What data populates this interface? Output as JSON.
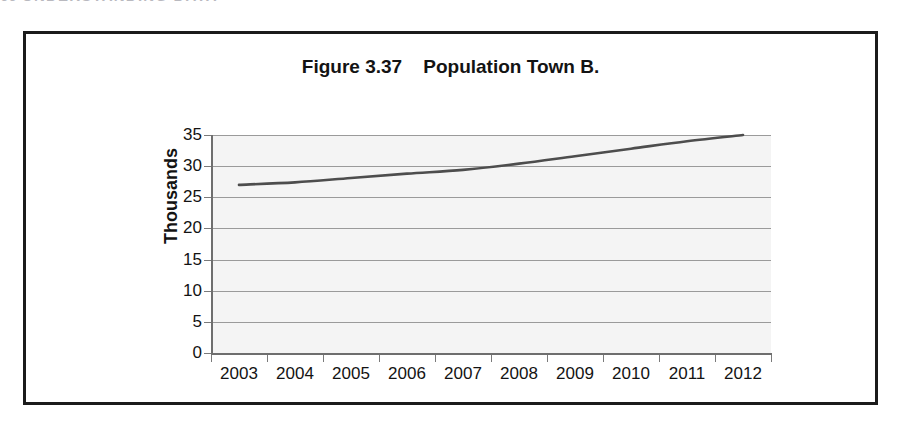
{
  "page": {
    "header_number": "66",
    "header_text": "UNDERSTANDING DATA"
  },
  "figure": {
    "title": "Figure 3.37    Population Town B."
  },
  "chart_data": {
    "type": "line",
    "title": "Figure 3.37    Population Town B.",
    "xlabel": "",
    "ylabel": "Thousands",
    "categories": [
      "2003",
      "2004",
      "2005",
      "2006",
      "2007",
      "2008",
      "2009",
      "2010",
      "2011",
      "2012"
    ],
    "values": [
      27.0,
      27.4,
      28.1,
      28.8,
      29.4,
      30.4,
      31.6,
      32.8,
      34.0,
      35.0
    ],
    "series": [
      {
        "name": "Population Town B",
        "values": [
          27.0,
          27.4,
          28.1,
          28.8,
          29.4,
          30.4,
          31.6,
          32.8,
          34.0,
          35.0
        ]
      }
    ],
    "ylim": [
      0,
      35
    ],
    "ytick_labels": [
      "0",
      "5",
      "10",
      "15",
      "20",
      "25",
      "30",
      "35"
    ],
    "ytick_values": [
      0,
      5,
      10,
      15,
      20,
      25,
      30,
      35
    ],
    "grid": true,
    "legend": false,
    "legend_position": "none",
    "line_color": "#4d4d4d",
    "plot_background": "#f4f4f4",
    "gridline_color": "#9a9a9a"
  }
}
